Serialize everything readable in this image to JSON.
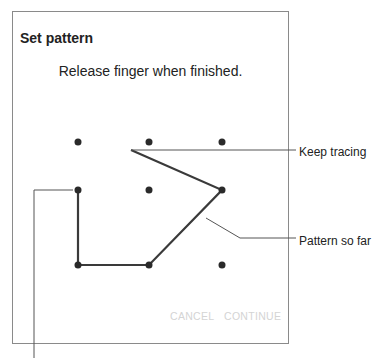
{
  "dialog": {
    "title": "Set pattern",
    "message": "Release finger when finished.",
    "buttons": {
      "cancel": "CANCEL",
      "continue": "CONTINUE"
    }
  },
  "pattern_grid": {
    "rows": 3,
    "cols": 3,
    "traced_path": [
      "row2-col1",
      "row3-col1",
      "row3-col2",
      "row2-col3",
      "in-progress"
    ]
  },
  "callouts": {
    "keep_tracing": "Keep tracing",
    "pattern_so_far": "Pattern so far"
  },
  "colors": {
    "dot": "#2a2a2a",
    "path": "#3a3a3a",
    "border": "#8a8a8a",
    "disabled_button": "#d4d4d4"
  }
}
